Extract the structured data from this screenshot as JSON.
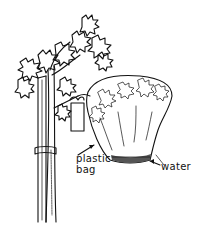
{
  "figure": {
    "labels": {
      "plastic_bag": [
        "plastic",
        "bag"
      ],
      "water": "water"
    },
    "colors": {
      "ink": "#111111",
      "background": "#ffffff"
    }
  }
}
